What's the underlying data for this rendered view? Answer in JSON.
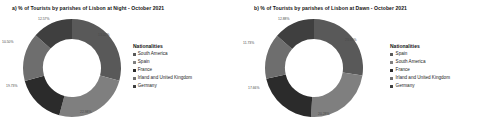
{
  "charts": [
    {
      "title": "a) % of Tourists by parishes of Lisbon at Night - October 2021",
      "legend_title": "Nationalities",
      "legend": [
        {
          "label": "South America",
          "color": "#595959"
        },
        {
          "label": "Spain",
          "color": "#7f7f7f"
        },
        {
          "label": "France",
          "color": "#2b2b2b"
        },
        {
          "label": "Irland and United Kingdom",
          "color": "#6e6e6e"
        },
        {
          "label": "Germany",
          "color": "#3f3f3f"
        }
      ]
    },
    {
      "title": "b) % of Tourists by parishes of Lisbon at Dawn - October 2021",
      "legend_title": "Nationalities",
      "legend": [
        {
          "label": "Spain",
          "color": "#595959"
        },
        {
          "label": "South America",
          "color": "#7f7f7f"
        },
        {
          "label": "France",
          "color": "#2b2b2b"
        },
        {
          "label": "Irland and United Kingdom",
          "color": "#6e6e6e"
        },
        {
          "label": "Germany",
          "color": "#3f3f3f"
        }
      ]
    }
  ],
  "chart_data": [
    {
      "type": "pie",
      "title": "a) % of Tourists by parishes of Lisbon at Night - October 2021",
      "subtitle": "",
      "xlabel": "",
      "ylabel": "",
      "legend_title": "Nationalities",
      "legend_position": "right",
      "donut": true,
      "categories": [
        "South America",
        "Spain",
        "France",
        "Irland and United Kingdom",
        "Germany"
      ],
      "values": [
        22.98,
        19.73,
        13.02,
        12.57,
        10.5
      ],
      "labels": [
        "22.98%",
        "19.73%",
        "13.02%",
        "12.57%",
        "10.50%"
      ],
      "colors": [
        "#595959",
        "#7f7f7f",
        "#2b2b2b",
        "#6e6e6e",
        "#3f3f3f"
      ]
    },
    {
      "type": "pie",
      "title": "b) % of Tourists by parishes of Lisbon at Dawn - October 2021",
      "subtitle": "",
      "xlabel": "",
      "ylabel": "",
      "legend_title": "Nationalities",
      "legend_position": "right",
      "donut": true,
      "categories": [
        "Spain",
        "South America",
        "France",
        "Irland and United Kingdom",
        "Germany"
      ],
      "values": [
        23.69,
        20.28,
        17.66,
        12.88,
        11.73
      ],
      "labels": [
        "23.69%",
        "20.28%",
        "17.66%",
        "12.88%",
        "11.73%"
      ],
      "colors": [
        "#595959",
        "#7f7f7f",
        "#2b2b2b",
        "#6e6e6e",
        "#3f3f3f"
      ]
    }
  ],
  "callouts": {
    "a": [
      {
        "text": "12.57%",
        "x": 38,
        "y": 17
      },
      {
        "text": "10.50%",
        "x": 2,
        "y": 40
      },
      {
        "text": "19.73%",
        "x": 6,
        "y": 84
      },
      {
        "text": "22.98%",
        "x": 80,
        "y": 110
      },
      {
        "text": "13.02%",
        "x": 98,
        "y": 33
      }
    ],
    "b": [
      {
        "text": "12.88%",
        "x": 278,
        "y": 17
      },
      {
        "text": "11.73%",
        "x": 243,
        "y": 41
      },
      {
        "text": "17.66%",
        "x": 248,
        "y": 86
      },
      {
        "text": "20.28%",
        "x": 318,
        "y": 112
      },
      {
        "text": "23.69%",
        "x": 345,
        "y": 38
      }
    ]
  }
}
